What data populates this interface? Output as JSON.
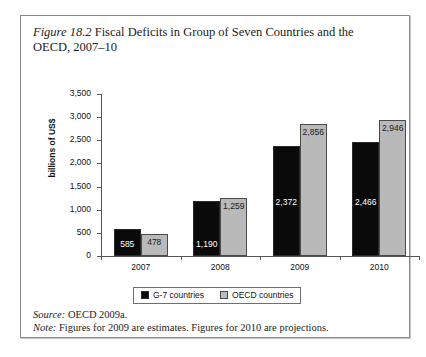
{
  "figure": {
    "number_label": "Figure 18.2",
    "caption_text": " Fiscal Deficits in Group of Seven Countries and the OECD, 2007–10"
  },
  "footnotes": {
    "source_lead": "Source:",
    "source_text": " OECD 2009a.",
    "note_lead": "Note:",
    "note_text": " Figures for 2009 are estimates. Figures for 2010 are projections."
  },
  "legend": {
    "entries": [
      {
        "label": "G-7 countries",
        "color": "#0a0a0a",
        "key": "g7"
      },
      {
        "label": "OECD countries",
        "color": "#bdbdbd",
        "key": "oecd"
      }
    ]
  },
  "chart_data": {
    "type": "bar",
    "title": "Fiscal Deficits in Group of Seven Countries and the OECD, 2007–10",
    "xlabel": "",
    "ylabel": "billions of US$",
    "categories": [
      "2007",
      "2008",
      "2009",
      "2010"
    ],
    "series": [
      {
        "name": "G-7 countries",
        "color": "#0a0a0a",
        "values": [
          585,
          1190,
          2372,
          2466
        ],
        "value_labels": [
          "585",
          "1,190",
          "2,372",
          "2,466"
        ]
      },
      {
        "name": "OECD countries",
        "color": "#bdbdbd",
        "values": [
          478,
          1259,
          2856,
          2946
        ],
        "value_labels": [
          "478",
          "1,259",
          "2,856",
          "2,946"
        ]
      }
    ],
    "ylim": [
      0,
      3500
    ],
    "ytick_values": [
      0,
      500,
      1000,
      1500,
      2000,
      2500,
      3000,
      3500
    ],
    "ytick_labels": [
      "0",
      "500",
      "1,000",
      "1,500",
      "2,000",
      "2,500",
      "3,000",
      "3,500"
    ],
    "grid": false,
    "legend_position": "bottom"
  }
}
